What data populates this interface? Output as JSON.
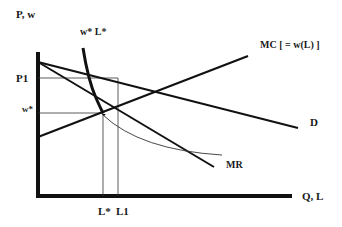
{
  "diagram": {
    "y_axis_label": "P, w",
    "x_axis_label": "Q, L",
    "curves": {
      "demand": "D",
      "marginal_revenue": "MR",
      "marginal_cost": "MC [ = w(L) ]",
      "wage_curve": "w* L*"
    },
    "levels": {
      "p1": "P1",
      "w_star": "w*"
    },
    "quantities": {
      "l_star": "L*",
      "l1": "L1"
    }
  }
}
